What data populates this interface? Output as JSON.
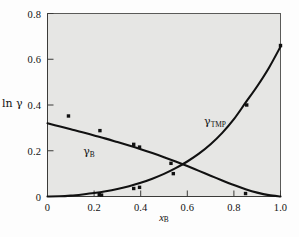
{
  "chart_data": {
    "type": "scatter",
    "title": "",
    "subtitle": "",
    "xlabel": "x_B",
    "ylabel": "ln γ",
    "xlabel_display": "x",
    "xlabel_sub": "B",
    "ylabel_display": "ln γ",
    "xlim": [
      0,
      1.0
    ],
    "ylim": [
      0,
      0.8
    ],
    "grid": false,
    "legend_position": "inline-annotation",
    "xticks": [
      0,
      0.2,
      0.4,
      0.6,
      0.8,
      1.0
    ],
    "xtick_labels": [
      "0",
      "0.2",
      "0.4",
      "0.6",
      "0.8",
      "1.0"
    ],
    "yticks": [
      0,
      0.2,
      0.4,
      0.6,
      0.8
    ],
    "ytick_labels": [
      "0",
      "0.2",
      "0.4",
      "0.6",
      "0.8"
    ],
    "annotations": [
      {
        "name": "gamma-b",
        "text": "γ",
        "sub": "B",
        "x": 0.18,
        "y": 0.245
      },
      {
        "name": "gamma-tmp",
        "text": "γ",
        "sub": "TMP",
        "x": 0.72,
        "y": 0.33
      }
    ],
    "series": [
      {
        "name": "γ_B",
        "label": "gamma-B",
        "kind": "decreasing-curve",
        "marker": "square",
        "color": "#111111",
        "curve_x": [
          0.0,
          0.05,
          0.1,
          0.15,
          0.2,
          0.25,
          0.3,
          0.35,
          0.4,
          0.45,
          0.5,
          0.55,
          0.6,
          0.65,
          0.7,
          0.75,
          0.8,
          0.85,
          0.9,
          0.95,
          1.0
        ],
        "curve_y": [
          0.32,
          0.307,
          0.294,
          0.281,
          0.267,
          0.253,
          0.238,
          0.223,
          0.207,
          0.19,
          0.172,
          0.153,
          0.133,
          0.112,
          0.091,
          0.07,
          0.05,
          0.032,
          0.017,
          0.006,
          0.0
        ],
        "points_x": [
          0.09,
          0.225,
          0.37,
          0.395,
          0.53,
          0.54,
          0.85
        ],
        "points_y": [
          0.352,
          0.288,
          0.228,
          0.216,
          0.145,
          0.1,
          0.013
        ]
      },
      {
        "name": "γ_TMP",
        "label": "gamma-TMP",
        "kind": "increasing-curve",
        "marker": "square",
        "color": "#111111",
        "curve_x": [
          0.0,
          0.05,
          0.1,
          0.15,
          0.2,
          0.25,
          0.3,
          0.35,
          0.4,
          0.45,
          0.5,
          0.55,
          0.6,
          0.65,
          0.7,
          0.75,
          0.8,
          0.85,
          0.9,
          0.95,
          1.0
        ],
        "curve_y": [
          0.0,
          0.001,
          0.004,
          0.009,
          0.015,
          0.023,
          0.033,
          0.045,
          0.06,
          0.078,
          0.099,
          0.124,
          0.153,
          0.187,
          0.228,
          0.278,
          0.338,
          0.41,
          0.482,
          0.562,
          0.655
        ],
        "points_x": [
          0.222,
          0.232,
          0.37,
          0.395,
          0.855,
          1.0
        ],
        "points_y": [
          0.008,
          0.006,
          0.035,
          0.04,
          0.4,
          0.66
        ]
      }
    ]
  },
  "figure": {
    "background": "#fdfdfd",
    "plot_background": "#e6e6e4",
    "axis_color": "#3b3b39",
    "marker_color": "#111111",
    "curve_color": "#111111"
  }
}
